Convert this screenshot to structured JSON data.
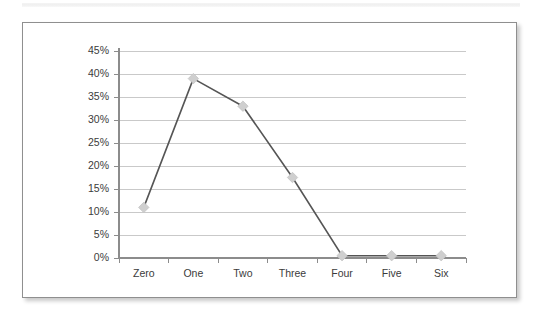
{
  "chart_data": {
    "type": "line",
    "title": "",
    "subtitle": "",
    "xlabel": "",
    "ylabel": "",
    "categories": [
      "Zero",
      "One",
      "Two",
      "Three",
      "Four",
      "Five",
      "Six"
    ],
    "values": [
      11,
      39,
      33,
      17.5,
      0.5,
      0.5,
      0.5
    ],
    "series": [
      {
        "name": "",
        "values": [
          11,
          39,
          33,
          17.5,
          0.5,
          0.5,
          0.5
        ]
      }
    ],
    "ylim": [
      0,
      45
    ],
    "ytick_step": 5,
    "ytick_labels": [
      "0%",
      "5%",
      "10%",
      "15%",
      "20%",
      "25%",
      "30%",
      "35%",
      "40%",
      "45%"
    ],
    "ytick_values": [
      0,
      5,
      10,
      15,
      20,
      25,
      30,
      35,
      40,
      45
    ],
    "grid": true,
    "grid_axis": "y",
    "legend": false,
    "legend_position": "none",
    "marker": "diamond",
    "colors": {
      "line": "#555555",
      "marker_fill": "#cfcfcf",
      "marker_stroke": "#c4c4c4",
      "gridline": "#c9c9c9",
      "axis": "#8c8c8c",
      "tick_text": "#3b3b3b",
      "frame_border": "#8f8f8f",
      "plot_background": "#ffffff"
    }
  },
  "frame": {
    "name": "chart-card"
  }
}
